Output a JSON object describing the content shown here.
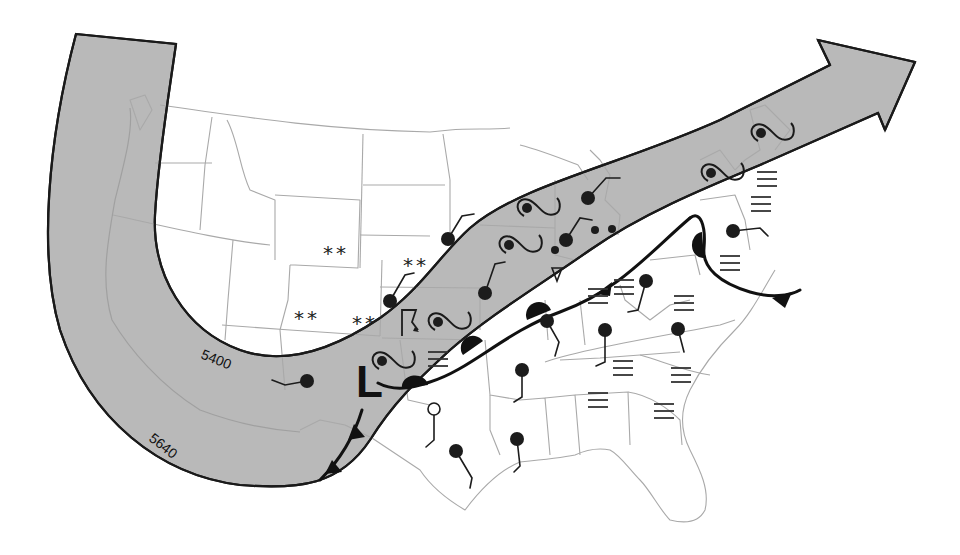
{
  "map": {
    "title": "Surface weather map with 500 mb jet stream band",
    "colors": {
      "band_fill": "#b9b9b9",
      "band_edge": "#1a1a1a",
      "state_lines": "#a9a9a9",
      "symbols": "#1c1c1c",
      "background": "#ffffff"
    },
    "contours": [
      {
        "label": "5400",
        "x": 200,
        "y": 358,
        "rotate": 22
      },
      {
        "label": "5640",
        "x": 148,
        "y": 440,
        "rotate": 38
      }
    ],
    "pressure_centers": [
      {
        "type": "low",
        "label": "L",
        "x": 356,
        "y": 397
      }
    ],
    "snow_markers": [
      {
        "text": "**",
        "x": 323,
        "y": 260
      },
      {
        "text": "**",
        "x": 403,
        "y": 272
      },
      {
        "text": "**",
        "x": 294,
        "y": 325
      },
      {
        "text": "**",
        "x": 352,
        "y": 330
      }
    ],
    "fog_markers": [
      {
        "x": 428,
        "y": 352
      },
      {
        "x": 614,
        "y": 280
      },
      {
        "x": 674,
        "y": 296
      },
      {
        "x": 613,
        "y": 361
      },
      {
        "x": 671,
        "y": 368
      },
      {
        "x": 588,
        "y": 393
      },
      {
        "x": 654,
        "y": 404
      },
      {
        "x": 720,
        "y": 256
      },
      {
        "x": 757,
        "y": 172
      },
      {
        "x": 751,
        "y": 197
      },
      {
        "x": 588,
        "y": 289
      }
    ],
    "rain_shower_markers": [
      {
        "text": "∇",
        "x": 557,
        "y": 268
      }
    ],
    "thunder_markers": [
      {
        "text": "⌈̲",
        "x": 410,
        "y": 322
      }
    ],
    "stations": [
      {
        "id": "st-1",
        "x": 448,
        "y": 239,
        "r": 7,
        "filled": true,
        "staff": [
          [
            448,
            239
          ],
          [
            462,
            216
          ],
          [
            474,
            214
          ]
        ]
      },
      {
        "id": "st-2",
        "x": 390,
        "y": 301,
        "r": 7,
        "filled": true,
        "staff": [
          [
            390,
            301
          ],
          [
            405,
            275
          ],
          [
            414,
            273
          ]
        ]
      },
      {
        "id": "st-3",
        "x": 485,
        "y": 293,
        "r": 7,
        "filled": true,
        "staff": [
          [
            485,
            293
          ],
          [
            495,
            264
          ],
          [
            505,
            262
          ]
        ]
      },
      {
        "id": "st-4",
        "x": 588,
        "y": 198,
        "r": 7,
        "filled": true,
        "staff": [
          [
            588,
            198
          ],
          [
            606,
            178
          ],
          [
            620,
            178
          ]
        ]
      },
      {
        "id": "st-5",
        "x": 566,
        "y": 240,
        "r": 7,
        "filled": true,
        "staff": [
          [
            566,
            240
          ],
          [
            580,
            218
          ],
          [
            592,
            220
          ]
        ]
      },
      {
        "id": "st-6",
        "x": 555,
        "y": 250,
        "r": 4,
        "filled": true,
        "staff": []
      },
      {
        "id": "st-7",
        "x": 595,
        "y": 230,
        "r": 4,
        "filled": true,
        "staff": []
      },
      {
        "id": "st-8",
        "x": 612,
        "y": 229,
        "r": 4,
        "filled": true,
        "staff": []
      },
      {
        "id": "st-9",
        "x": 733,
        "y": 231,
        "r": 7,
        "filled": true,
        "staff": [
          [
            733,
            231
          ],
          [
            760,
            228
          ],
          [
            768,
            236
          ]
        ]
      },
      {
        "id": "st-10",
        "x": 646,
        "y": 281,
        "r": 7,
        "filled": true,
        "staff": [
          [
            646,
            281
          ],
          [
            638,
            310
          ],
          [
            628,
            312
          ]
        ]
      },
      {
        "id": "st-11",
        "x": 547,
        "y": 321,
        "r": 7,
        "filled": true,
        "staff": [
          [
            547,
            321
          ],
          [
            559,
            342
          ],
          [
            555,
            356
          ]
        ]
      },
      {
        "id": "st-12",
        "x": 605,
        "y": 330,
        "r": 7,
        "filled": true,
        "staff": [
          [
            605,
            330
          ],
          [
            605,
            362
          ],
          [
            596,
            366
          ]
        ]
      },
      {
        "id": "st-13",
        "x": 678,
        "y": 329,
        "r": 7,
        "filled": true,
        "staff": [
          [
            678,
            329
          ],
          [
            684,
            352
          ]
        ]
      },
      {
        "id": "st-14",
        "x": 522,
        "y": 370,
        "r": 7,
        "filled": true,
        "staff": [
          [
            522,
            370
          ],
          [
            522,
            397
          ],
          [
            514,
            402
          ]
        ]
      },
      {
        "id": "st-15",
        "x": 307,
        "y": 381,
        "r": 7,
        "filled": true,
        "staff": [
          [
            307,
            381
          ],
          [
            285,
            385
          ],
          [
            272,
            380
          ]
        ]
      },
      {
        "id": "st-16",
        "x": 434,
        "y": 409,
        "r": 6,
        "filled": false,
        "staff": [
          [
            434,
            415
          ],
          [
            434,
            440
          ],
          [
            426,
            447
          ]
        ]
      },
      {
        "id": "st-17",
        "x": 517,
        "y": 439,
        "r": 7,
        "filled": true,
        "staff": [
          [
            517,
            439
          ],
          [
            520,
            466
          ],
          [
            514,
            472
          ]
        ]
      },
      {
        "id": "st-18",
        "x": 456,
        "y": 451,
        "r": 7,
        "filled": true,
        "staff": [
          [
            456,
            451
          ],
          [
            472,
            478
          ],
          [
            470,
            488
          ]
        ]
      }
    ],
    "squall_symbols": [
      {
        "x": 509,
        "y": 245
      },
      {
        "x": 438,
        "y": 322
      },
      {
        "x": 382,
        "y": 361
      },
      {
        "x": 527,
        "y": 208
      },
      {
        "x": 711,
        "y": 173
      },
      {
        "x": 761,
        "y": 133
      }
    ],
    "fronts": [
      {
        "type": "stationary",
        "path": "M378,383 C395,392 412,388 430,382 C470,370 505,332 560,312 C620,290 650,252 690,218"
      },
      {
        "type": "warm",
        "path": "M690,218 C700,210 706,225 704,248 C702,268 720,283 750,292 C770,298 790,296 800,290"
      },
      {
        "type": "cold",
        "path": "M362,410 C356,430 345,455 320,480"
      }
    ]
  }
}
